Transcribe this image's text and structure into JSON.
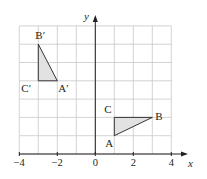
{
  "diagram": {
    "type": "coordinate-grid-transformation",
    "axes": {
      "x_label": "x",
      "y_label": "y",
      "x_range": [
        -4,
        4
      ],
      "y_range": [
        0,
        7
      ],
      "x_ticks": [
        {
          "value": -4,
          "label": "−4"
        },
        {
          "value": -2,
          "label": "−2"
        },
        {
          "value": 0,
          "label": "0"
        },
        {
          "value": 2,
          "label": "2"
        },
        {
          "value": 4,
          "label": "4"
        }
      ],
      "grid": true
    },
    "triangles": [
      {
        "name": "ABC",
        "fill": "#e2e2e2",
        "vertices": [
          {
            "label": "A",
            "x": 1,
            "y": 1
          },
          {
            "label": "B",
            "x": 3,
            "y": 2
          },
          {
            "label": "C",
            "x": 1,
            "y": 2
          }
        ]
      },
      {
        "name": "A'B'C'",
        "fill": "#e2e2e2",
        "vertices": [
          {
            "label": "A′",
            "x": -2,
            "y": 4
          },
          {
            "label": "B′",
            "x": -3,
            "y": 6
          },
          {
            "label": "C′",
            "x": -3,
            "y": 4
          }
        ]
      }
    ],
    "colors": {
      "grid": "#c8c8c8",
      "axis": "#231f20",
      "triangle_edge": "#231f20",
      "triangle_fill": "#e2e2e2"
    }
  }
}
